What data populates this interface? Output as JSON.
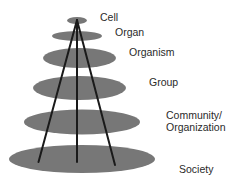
{
  "diagram": {
    "type": "nested-levels-cone",
    "colors": {
      "ellipse_fill": "#777777",
      "line_stroke": "#1a1a1a",
      "label_text": "#2a2a2a",
      "background": "#ffffff"
    },
    "levels": [
      {
        "label": "Cell",
        "lines": [
          "Cell"
        ]
      },
      {
        "label": "Organ",
        "lines": [
          "Organ"
        ]
      },
      {
        "label": "Organism",
        "lines": [
          "Organism"
        ]
      },
      {
        "label": "Group",
        "lines": [
          "Group"
        ]
      },
      {
        "label": "Community/ Organization",
        "lines": [
          "Community/",
          "Organization"
        ]
      },
      {
        "label": "Society",
        "lines": [
          "Society"
        ]
      }
    ]
  }
}
